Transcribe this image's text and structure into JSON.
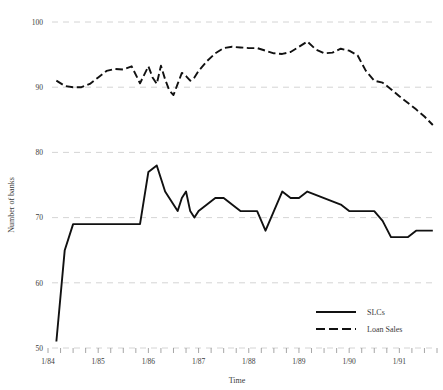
{
  "chart_data": {
    "type": "line",
    "title": "",
    "xlabel": "Time",
    "ylabel": "Number of banks",
    "ylim": [
      50,
      100
    ],
    "yticks": [
      50,
      60,
      70,
      80,
      90,
      100
    ],
    "grid": true,
    "legend_position": "bottom-right",
    "x_tick_labels": [
      "1/84",
      "1/85",
      "1/86",
      "1/87",
      "1/88",
      "1/89",
      "1/90",
      "1/91"
    ],
    "x_tick_values": [
      0,
      12,
      24,
      36,
      48,
      60,
      72,
      84
    ],
    "x_minor_tick_interval_months": 3,
    "x_range_months": [
      0,
      93
    ],
    "series": [
      {
        "name": "SLCs",
        "style": "solid",
        "color": "#111111",
        "x": [
          2,
          4,
          6,
          8,
          10,
          12,
          14,
          16,
          18,
          20,
          22,
          24,
          25,
          26,
          27,
          28,
          29,
          30,
          31,
          32,
          33,
          34,
          35,
          36,
          38,
          40,
          42,
          44,
          46,
          48,
          50,
          52,
          54,
          56,
          58,
          60,
          62,
          64,
          66,
          68,
          70,
          72,
          74,
          76,
          78,
          80,
          82,
          84,
          86,
          88,
          90,
          92
        ],
        "values": [
          51,
          65,
          69,
          69,
          69,
          69,
          69,
          69,
          69,
          69,
          69,
          77,
          77.5,
          78,
          76,
          74,
          73,
          72,
          71,
          73,
          74,
          71,
          70,
          71,
          72,
          73,
          73,
          72,
          71,
          71,
          71,
          68,
          71,
          74,
          73,
          73,
          74,
          73.5,
          73,
          72.5,
          72,
          71,
          71,
          71,
          71,
          69.5,
          67,
          67,
          67,
          68,
          68,
          68
        ]
      },
      {
        "name": "Loan Sales",
        "style": "dashed",
        "color": "#111111",
        "x": [
          2,
          4,
          6,
          8,
          10,
          12,
          14,
          16,
          18,
          20,
          22,
          24,
          25,
          26,
          27,
          28,
          29,
          30,
          31,
          32,
          33,
          34,
          35,
          36,
          38,
          40,
          42,
          44,
          46,
          48,
          50,
          52,
          54,
          56,
          58,
          60,
          62,
          64,
          66,
          68,
          70,
          72,
          74,
          76,
          78,
          80,
          82,
          84,
          86,
          88,
          90,
          92
        ],
        "values": [
          91,
          90.2,
          90,
          90,
          90.5,
          91.5,
          92.5,
          92.8,
          92.7,
          93.2,
          90.6,
          93.2,
          91.5,
          90.5,
          93.3,
          91.2,
          89.5,
          88.8,
          90.5,
          92.2,
          91.7,
          91,
          91.5,
          92.5,
          94,
          95.2,
          96,
          96.2,
          96.1,
          96,
          96,
          95.6,
          95.2,
          95.1,
          95.4,
          96.2,
          97,
          95.8,
          95.2,
          95.3,
          95.9,
          95.6,
          94.9,
          92.5,
          91,
          90.7,
          89.7,
          88.6,
          87.6,
          86.6,
          85.5,
          84.2
        ]
      }
    ]
  },
  "legend": {
    "entries": [
      {
        "label": "SLCs",
        "style": "solid"
      },
      {
        "label": "Loan Sales",
        "style": "dashed"
      }
    ]
  }
}
